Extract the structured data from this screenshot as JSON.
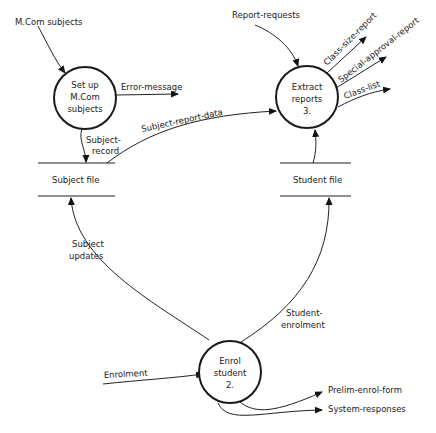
{
  "diagram": {
    "type": "data-flow-diagram",
    "processes": [
      {
        "id": "p1",
        "lines": [
          "Set up",
          "M.Com",
          "subjects"
        ]
      },
      {
        "id": "p2",
        "lines": [
          "Enrol",
          "student",
          "2."
        ]
      },
      {
        "id": "p3",
        "lines": [
          "Extract",
          "reports",
          "3."
        ]
      }
    ],
    "stores": [
      {
        "id": "s1",
        "label": "Subject file"
      },
      {
        "id": "s2",
        "label": "Student file"
      }
    ],
    "flows": {
      "mcom_subjects": "M.Com subjects",
      "error_message": "Error-message",
      "subject_record_1": "Subject-",
      "subject_record_2": "record",
      "subject_report_data": "Subject-report-data",
      "report_requests": "Report-requests",
      "class_size_report": "Class-size-report",
      "special_approval_report": "Special-approval-report",
      "class_list": "Class-list",
      "subject_updates_1": "Subject",
      "subject_updates_2": "updates",
      "student_enrolment_1": "Student-",
      "student_enrolment_2": "enrolment",
      "enrolment": "Enrolment",
      "prelim_enrol_form": "Prelim-enrol-form",
      "system_responses": "System-responses"
    }
  }
}
